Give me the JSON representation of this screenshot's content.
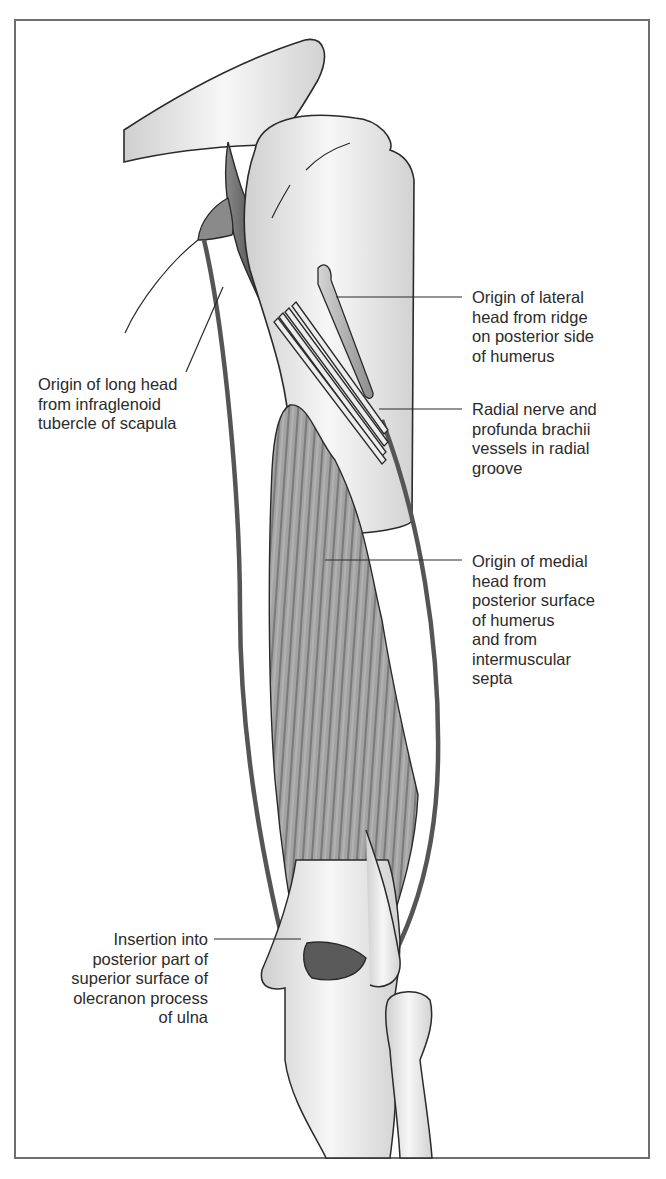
{
  "figure": {
    "labels": [
      {
        "id": "lateral-head",
        "text": "Origin of lateral\nhead from ridge\non posterior side\nof humerus"
      },
      {
        "id": "long-head",
        "text": "Origin of long head\nfrom infraglenoid\ntubercle of scapula"
      },
      {
        "id": "radial-nerve",
        "text": "Radial nerve and\nprofunda brachii\nvessels in radial\ngroove"
      },
      {
        "id": "medial-head",
        "text": "Origin of medial\nhead from\nposterior surface\nof humerus\nand from\nintermuscular\nsepta"
      },
      {
        "id": "insertion",
        "text": "Insertion into\nposterior part of\nsuperior surface of\nolecranon process\nof ulna"
      }
    ],
    "colors": {
      "outline": "#2a2a2a",
      "bone": "#e6e6e6",
      "muscle": "#9a9a9a",
      "muscle_dark": "#5e5e5e",
      "tendon": "#505050",
      "frame": "#6e6e6e",
      "text": "#2b2b2b"
    }
  }
}
